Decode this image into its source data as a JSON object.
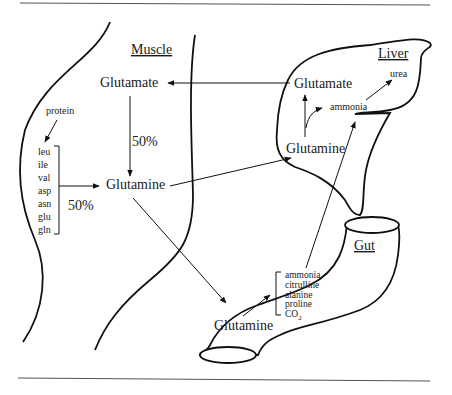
{
  "diagram": {
    "type": "glutamine inter-organ metabolism",
    "rules": {
      "top": true,
      "bottom": true
    },
    "muscle": {
      "title": "Muscle",
      "glutamate": "Glutamate",
      "glutamine": "Glutamine",
      "glutamate_to_glutamine_pct": "50%",
      "protein": "protein",
      "amino_acids": [
        "leu",
        "ile",
        "val",
        "asp",
        "asn",
        "glu",
        "gln"
      ],
      "amino_acids_to_glutamine_pct": "50%"
    },
    "liver": {
      "title": "Liver",
      "glutamate": "Glutamate",
      "glutamine": "Glutamine",
      "ammonia": "ammonia",
      "urea": "urea"
    },
    "gut": {
      "title": "Gut",
      "glutamine": "Glutamine",
      "products": [
        "ammonia",
        "citrulline",
        "alanine",
        "proline",
        "CO"
      ],
      "co2_subscript": "2"
    },
    "edges": [
      {
        "from": "liver.glutamate",
        "to": "muscle.glutamate"
      },
      {
        "from": "muscle.glutamate",
        "to": "muscle.glutamine",
        "label": "50%"
      },
      {
        "from": "muscle.amino_acids",
        "to": "muscle.glutamine",
        "label": "50%"
      },
      {
        "from": "muscle.protein",
        "to": "muscle.amino_acids"
      },
      {
        "from": "muscle.glutamine",
        "to": "liver.glutamine"
      },
      {
        "from": "muscle.glutamine",
        "to": "gut.glutamine"
      },
      {
        "from": "liver.glutamine",
        "to": "liver.glutamate"
      },
      {
        "from": "liver.glutamine",
        "to": "liver.ammonia"
      },
      {
        "from": "liver.ammonia",
        "to": "liver.urea"
      },
      {
        "from": "gut.products.ammonia",
        "to": "liver.ammonia"
      },
      {
        "from": "gut.glutamine",
        "to": "gut.products"
      }
    ]
  }
}
